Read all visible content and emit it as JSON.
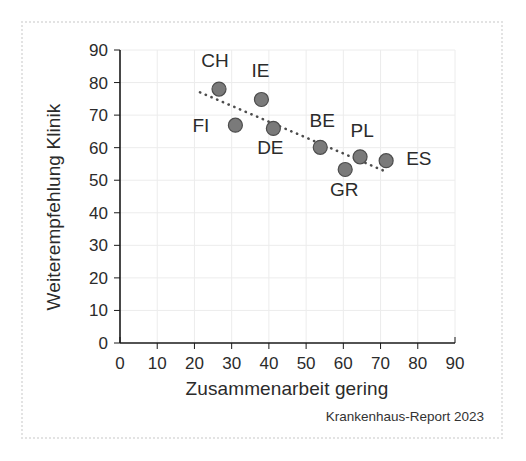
{
  "figure": {
    "footnote": "Krankenhaus-Report 2023",
    "frame_color": "#e3e3e3",
    "background": "#ffffff"
  },
  "chart_data": {
    "type": "scatter",
    "title": "",
    "xlabel": "Zusammenarbeit gering",
    "ylabel": "Weiterempfehlung Klinik",
    "xlim": [
      0,
      90
    ],
    "ylim": [
      0,
      90
    ],
    "xticks": [
      0,
      10,
      20,
      30,
      40,
      50,
      60,
      70,
      80,
      90
    ],
    "yticks": [
      0,
      10,
      20,
      30,
      40,
      50,
      60,
      70,
      80,
      90
    ],
    "xtick_labels": [
      "0",
      "10",
      "20",
      "30",
      "40",
      "50",
      "60",
      "70",
      "80",
      "90"
    ],
    "ytick_labels": [
      "0",
      "10",
      "20",
      "30",
      "40",
      "50",
      "60",
      "70",
      "80",
      "90"
    ],
    "grid": true,
    "grid_color": "#ececec",
    "legend": "none",
    "marker_color": "#7a7a7a",
    "marker_edge_color": "#4d4d4d",
    "marker_radius": 7,
    "points": [
      {
        "label": "CH",
        "x": 26.6,
        "y": 78.0,
        "label_dx": -4,
        "label_dy": -22
      },
      {
        "label": "IE",
        "x": 38.0,
        "y": 74.8,
        "label_dx": -1,
        "label_dy": -22
      },
      {
        "label": "FI",
        "x": 31.0,
        "y": 66.9,
        "label_dx": -26,
        "label_dy": 7
      },
      {
        "label": "DE",
        "x": 41.2,
        "y": 65.9,
        "label_dx": -3,
        "label_dy": 26
      },
      {
        "label": "BE",
        "x": 53.8,
        "y": 60.1,
        "label_dx": 2,
        "label_dy": -20
      },
      {
        "label": "GR",
        "x": 60.5,
        "y": 53.3,
        "label_dx": -1,
        "label_dy": 27
      },
      {
        "label": "PL",
        "x": 64.5,
        "y": 57.2,
        "label_dx": 2,
        "label_dy": -20
      },
      {
        "label": "ES",
        "x": 71.5,
        "y": 56.0,
        "label_dx": 20,
        "label_dy": 4
      }
    ],
    "trendline": {
      "style": "dotted",
      "color": "#4d4d4d",
      "x_start": 21.5,
      "y_start": 77.0,
      "x_end": 71.5,
      "y_end": 52.6
    }
  }
}
